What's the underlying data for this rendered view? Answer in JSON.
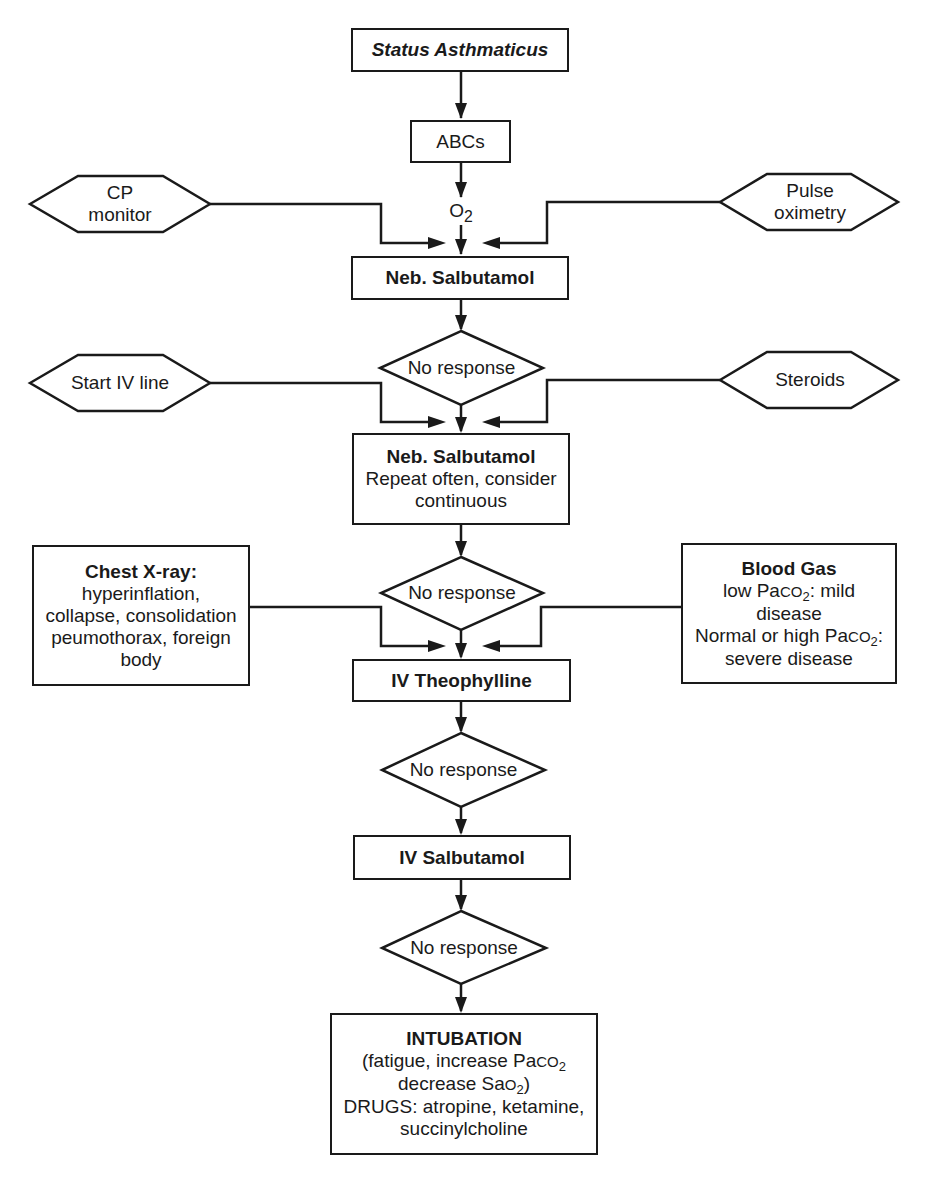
{
  "diagram": {
    "title": "Status Asthmaticus",
    "stroke_color": "#1a1a1a",
    "background_color": "#ffffff"
  },
  "nodes": {
    "status": {
      "text": "Status Asthmaticus"
    },
    "abcs": {
      "text": "ABCs"
    },
    "o2": {
      "base": "O",
      "sub": "2"
    },
    "cp_monitor": {
      "line1": "CP",
      "line2": "monitor"
    },
    "pulse_oximetry": {
      "line1": "Pulse",
      "line2": "oximetry"
    },
    "neb1": {
      "text": "Neb. Salbutamol"
    },
    "decision1": {
      "text": "No response"
    },
    "start_iv": {
      "text": "Start IV line"
    },
    "steroids": {
      "text": "Steroids"
    },
    "neb2": {
      "title": "Neb. Salbutamol",
      "line1": "Repeat often, consider",
      "line2": "continuous"
    },
    "decision2": {
      "text": "No response"
    },
    "chest_xray": {
      "title": "Chest X-ray:",
      "line1": "hyperinflation,",
      "line2": "collapse, consolidation",
      "line3": "peumothorax, foreign",
      "line4": "body"
    },
    "blood_gas": {
      "title": "Blood Gas",
      "line1_pre": "low Pa",
      "line1_co": "CO",
      "line1_sub": "2",
      "line1_post": ": mild",
      "line2": "disease",
      "line3_pre": "Normal or high Pa",
      "line3_co": "CO",
      "line3_sub": "2",
      "line3_post": ":",
      "line4": "severe disease"
    },
    "theophylline": {
      "text": "IV Theophylline"
    },
    "decision3": {
      "text": "No response"
    },
    "iv_salbutamol": {
      "text": "IV Salbutamol"
    },
    "decision4": {
      "text": "No response"
    },
    "intubation": {
      "title": "INTUBATION",
      "line1_pre": "(fatigue, increase Pa",
      "line1_co": "CO",
      "line1_sub": "2",
      "line2_pre": "decrease Sa",
      "line2_o": "O",
      "line2_sub": "2",
      "line2_post": ")",
      "line3": "DRUGS: atropine, ketamine,",
      "line4": "succinylcholine"
    }
  },
  "edges": [
    {
      "from": "status",
      "to": "abcs"
    },
    {
      "from": "abcs",
      "to": "o2"
    },
    {
      "from": "o2",
      "to": "neb1"
    },
    {
      "from": "cp_monitor",
      "to": "neb1"
    },
    {
      "from": "pulse_oximetry",
      "to": "neb1"
    },
    {
      "from": "neb1",
      "to": "decision1"
    },
    {
      "from": "decision1",
      "to": "neb2"
    },
    {
      "from": "start_iv",
      "to": "neb2"
    },
    {
      "from": "steroids",
      "to": "neb2"
    },
    {
      "from": "neb2",
      "to": "decision2"
    },
    {
      "from": "decision2",
      "to": "theophylline"
    },
    {
      "from": "chest_xray",
      "to": "theophylline"
    },
    {
      "from": "blood_gas",
      "to": "theophylline"
    },
    {
      "from": "theophylline",
      "to": "decision3"
    },
    {
      "from": "decision3",
      "to": "iv_salbutamol"
    },
    {
      "from": "iv_salbutamol",
      "to": "decision4"
    },
    {
      "from": "decision4",
      "to": "intubation"
    }
  ]
}
